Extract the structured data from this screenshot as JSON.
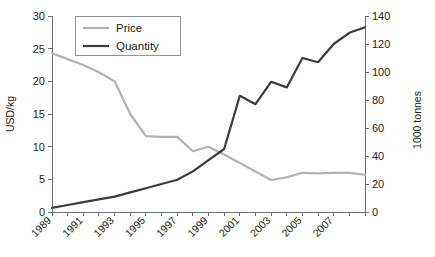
{
  "chart_data": {
    "type": "line",
    "title": "",
    "xlabel": "",
    "ylabel": "USD/kg",
    "y2label": "1000 tonnes",
    "x": [
      1989,
      1990,
      1991,
      1992,
      1993,
      1994,
      1995,
      1996,
      1997,
      1998,
      1999,
      2000,
      2001,
      2002,
      2003,
      2004,
      2005,
      2006,
      2007,
      2008,
      2009
    ],
    "xtick_labels": [
      "1989",
      "1991",
      "1993",
      "1995",
      "1997",
      "1999",
      "2001",
      "2003",
      "2005",
      "2007"
    ],
    "ytick_labels": [
      "0",
      "5",
      "10",
      "15",
      "20",
      "25",
      "30"
    ],
    "y2tick_labels": [
      "0",
      "20",
      "40",
      "60",
      "80",
      "100",
      "120",
      "140"
    ],
    "ylim": [
      0,
      30
    ],
    "y2lim": [
      0,
      140
    ],
    "grid": false,
    "legend_position": "top-left",
    "series": [
      {
        "name": "Price",
        "axis": "left",
        "color": "#b3b3b3",
        "width": 2.2,
        "values": [
          24.3,
          23.4,
          22.5,
          21.4,
          20.0,
          15.0,
          11.6,
          11.5,
          11.5,
          9.3,
          10.0,
          8.8,
          7.5,
          6.2,
          4.9,
          5.3,
          6.0,
          5.9,
          6.0,
          6.0,
          5.7
        ]
      },
      {
        "name": "Quantity",
        "axis": "right",
        "color": "#3b3b3b",
        "width": 2.2,
        "values": [
          3.0,
          5.0,
          7.0,
          9.0,
          11.0,
          14.0,
          17.0,
          20.0,
          23.0,
          29.0,
          37.0,
          45.0,
          83.0,
          77.0,
          93.0,
          89.0,
          110.0,
          107.0,
          120.0,
          128.0,
          132.0
        ]
      }
    ]
  },
  "axes": {
    "left_title": "USD/kg",
    "right_title": "1000 tonnes"
  },
  "legend": {
    "items": [
      {
        "label": "Price"
      },
      {
        "label": "Quantity"
      }
    ]
  }
}
